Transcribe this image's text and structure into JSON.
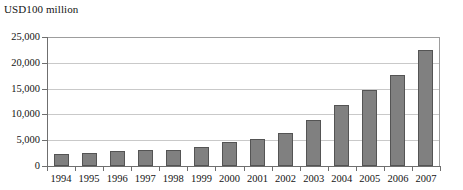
{
  "chart_data": {
    "type": "bar",
    "title": "USD100 million",
    "xlabel": "",
    "ylabel": "USD100 million",
    "categories": [
      "1994",
      "1995",
      "1996",
      "1997",
      "1998",
      "1999",
      "2000",
      "2001",
      "2002",
      "2003",
      "2004",
      "2005",
      "2006",
      "2007"
    ],
    "values": [
      2400,
      2600,
      2900,
      3200,
      3100,
      3700,
      4700,
      5200,
      6400,
      8900,
      11900,
      14700,
      17600,
      22400
    ],
    "ylim": [
      0,
      25000
    ],
    "yticks": [
      0,
      5000,
      10000,
      15000,
      20000,
      25000
    ],
    "ytick_labels": [
      "0",
      "5,000",
      "10,000",
      "15,000",
      "20,000",
      "25,000"
    ],
    "grid": true,
    "legend": false,
    "bar_color": "#808080",
    "bar_edge_color": "#545454",
    "gridline_color": "#c9c9c9",
    "axis_color": "#6f6f6f"
  }
}
